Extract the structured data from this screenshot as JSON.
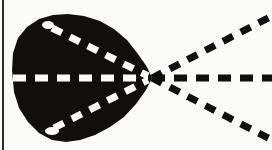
{
  "figure": {
    "width": 272,
    "height": 150,
    "background_color": "#fbfbfa",
    "ink_color": "#100f0d",
    "highlight_color": "#fdfdfc",
    "border": {
      "name": "left-edge-rule",
      "x": 3,
      "y_start": 0,
      "y_end": 150,
      "thickness": 2,
      "color": "#2c2b29"
    },
    "blob": {
      "name": "solid-black-region",
      "fill_color": "#100f0d",
      "bounds": {
        "left": 12,
        "top": 14,
        "right": 152,
        "bottom": 143
      },
      "apex": {
        "x": 152,
        "y": 78
      },
      "notches": [
        {
          "name": "upper-left-notch",
          "x": 48,
          "y": 25,
          "rx": 6,
          "ry": 4
        },
        {
          "name": "lower-left-notch",
          "x": 52,
          "y": 131,
          "rx": 7,
          "ry": 4
        }
      ],
      "outline_points": "12,70 13,53 18,38 27,27 39,19 53,15 68,14 84,16 100,21 114,29 127,40 138,54 147,67 152,78 146,90 136,104 124,117 110,127 95,135 80,140 66,142 52,140 39,133 28,122 19,108 14,92"
    },
    "vertex": {
      "name": "ray-convergence-point",
      "x": 152,
      "y": 78,
      "label": "convergence point"
    },
    "rays": [
      {
        "name": "upper-ray",
        "angle_deg": -27,
        "start": {
          "x": 152,
          "y": 78
        },
        "end": {
          "x": 272,
          "y": 16
        },
        "inner_segment_color": "#fdfdfc",
        "outer_segment_color": "#100f0d",
        "dash_length": 11,
        "dash_gap": 9,
        "stroke_width": 7,
        "inner_from": {
          "x": 52,
          "y": 28
        },
        "inner_to": {
          "x": 148,
          "y": 76
        }
      },
      {
        "name": "middle-ray",
        "angle_deg": 0,
        "start": {
          "x": 152,
          "y": 78
        },
        "end": {
          "x": 272,
          "y": 78
        },
        "inner_segment_color": "#fdfdfc",
        "outer_segment_color": "#100f0d",
        "dash_length": 13,
        "dash_gap": 9,
        "stroke_width": 7,
        "inner_from": {
          "x": 13,
          "y": 78
        },
        "inner_to": {
          "x": 148,
          "y": 78
        }
      },
      {
        "name": "lower-ray",
        "angle_deg": 27,
        "start": {
          "x": 152,
          "y": 78
        },
        "end": {
          "x": 272,
          "y": 140
        },
        "inner_segment_color": "#fdfdfc",
        "outer_segment_color": "#100f0d",
        "dash_length": 11,
        "dash_gap": 9,
        "stroke_width": 7,
        "inner_from": {
          "x": 54,
          "y": 128
        },
        "inner_to": {
          "x": 148,
          "y": 80
        }
      }
    ]
  }
}
